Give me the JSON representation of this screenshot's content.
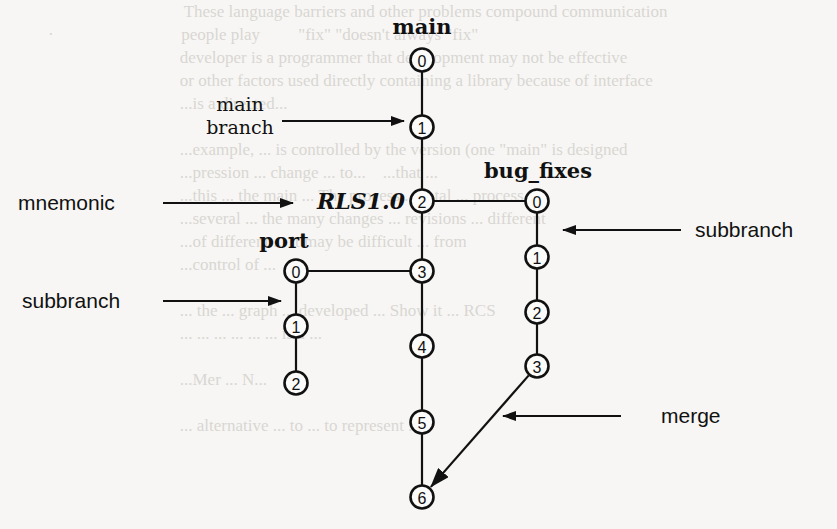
{
  "figure": {
    "type": "revision-branch-diagram",
    "background_text_lines": [
      "                                        These language barriers and other problems compound communication",
      "        ·                              people play         \"fix\" \"doesn't always \"fix\"",
      "                                       developer is a programmer that development may not be effective",
      "                                       or other factors used directly containing a library because of interface",
      "                                       ...is a directed...",
      "",
      "                                       ...example, ... is controlled by the version (one \"main\" is designed",
      "                                       ...pression ... change ... to...    ...that ... ",
      "                                       ...this ... the main ... The process ... total ... process",
      "                                       ...several ... the many changes ... revisions ... different",
      "                                       ...of different ... it may be difficult ... from",
      "                                       ...control of ... ",
      "",
      "                                       ... the ... graph ... developed ... Show it ... RCS",
      "                                       ... ... ... ... ... ... is a ... ",
      "",
      "                                       ...Mer ... N... ",
      "",
      "                                       ... alternative ... to ... to represent ... "
    ],
    "branches": [
      {
        "name": "main",
        "label": "main",
        "x": 422,
        "label_pos": {
          "x": 422,
          "y": 34
        },
        "revisions": [
          {
            "id": "0",
            "y": 60
          },
          {
            "id": "1",
            "y": 127
          },
          {
            "id": "2",
            "y": 201
          },
          {
            "id": "3",
            "y": 271
          },
          {
            "id": "4",
            "y": 346
          },
          {
            "id": "5",
            "y": 422
          },
          {
            "id": "6",
            "y": 497
          }
        ]
      },
      {
        "name": "bug_fixes",
        "label": "bug_fixes",
        "x": 537,
        "label_pos": {
          "x": 538,
          "y": 178
        },
        "branches_from": {
          "branch": "main",
          "revision": "2"
        },
        "revisions": [
          {
            "id": "0",
            "y": 201
          },
          {
            "id": "1",
            "y": 257
          },
          {
            "id": "2",
            "y": 312
          },
          {
            "id": "3",
            "y": 366
          }
        ]
      },
      {
        "name": "port",
        "label": "port",
        "x": 296,
        "label_pos": {
          "x": 284,
          "y": 248
        },
        "branches_from": {
          "branch": "main",
          "revision": "3"
        },
        "revisions": [
          {
            "id": "0",
            "y": 271
          },
          {
            "id": "1",
            "y": 326
          },
          {
            "id": "2",
            "y": 383
          }
        ]
      }
    ],
    "merge": {
      "from": {
        "branch": "bug_fixes",
        "revision": "3"
      },
      "to": {
        "branch": "main",
        "revision": "6"
      }
    },
    "mnemonic": {
      "text": "RLS1.0",
      "attached_to": {
        "branch": "main",
        "revision": "2"
      }
    },
    "annotations": [
      {
        "id": "main-branch",
        "text_lines": [
          "main",
          "branch"
        ],
        "points_to": "main trunk revision 1"
      },
      {
        "id": "mnemonic",
        "text_lines": [
          "mnemonic"
        ],
        "points_to": "RLS1.0 label"
      },
      {
        "id": "subbranch-right",
        "text_lines": [
          "subbranch"
        ],
        "points_to": "bug_fixes branch"
      },
      {
        "id": "subbranch-left",
        "text_lines": [
          "subbranch"
        ],
        "points_to": "port branch"
      },
      {
        "id": "merge",
        "text_lines": [
          "merge"
        ],
        "points_to": "merge arrow into main revision 6"
      }
    ],
    "colors": {
      "ink": "#111111",
      "paper": "#f7f6f4",
      "bleed_through": "#d9d7d3"
    }
  }
}
